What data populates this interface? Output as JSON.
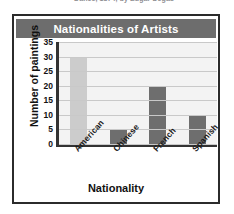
{
  "page": {
    "caption_cutoff": "Dance, 1874, by Edgar Degas"
  },
  "chart_data": {
    "type": "bar",
    "title": "Nationalities of Artists",
    "xlabel": "Nationality",
    "ylabel": "Number of paintings",
    "categories": [
      "American",
      "Chinese",
      "French",
      "Spanish"
    ],
    "values": [
      30,
      5,
      20,
      10
    ],
    "ylim": [
      0,
      35
    ],
    "yticks": [
      35,
      30,
      25,
      20,
      15,
      10,
      5,
      0
    ],
    "grid": true,
    "legend": "none",
    "bar_colors": [
      "#cccccc",
      "#6e6e6e",
      "#6e6e6e",
      "#6e6e6e"
    ],
    "title_banner_color": "#6d6d6d",
    "title_text_color": "#ffffff",
    "plot_background": "#f3f3f3",
    "gridline_color": "#c9c9c9",
    "axis_color": "#333333",
    "frame_color": "#2b2b2b"
  }
}
